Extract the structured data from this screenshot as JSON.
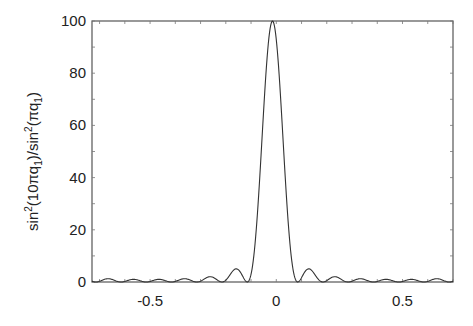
{
  "chart_data": {
    "type": "line",
    "title": "",
    "xlabel": "",
    "ylabel": "sin²(10πq₁)/sin²(πq₁)",
    "ylabel_parts": {
      "a": "sin",
      "sup1": "2",
      "b": "(10πq",
      "sub1": "1",
      "c": ")/sin",
      "sup2": "2",
      "d": "(πq",
      "sub2": "1",
      "e": ")"
    },
    "xlim": [
      -0.73,
      0.7
    ],
    "ylim": [
      0,
      100
    ],
    "x_ticks": [
      -0.5,
      0,
      0.5
    ],
    "x_tick_labels": [
      "-0.5",
      "0",
      "0.5"
    ],
    "x_minor_step": 0.1,
    "y_ticks": [
      0,
      20,
      40,
      60,
      80,
      100
    ],
    "y_tick_labels": [
      "0",
      "20",
      "40",
      "60",
      "80",
      "100"
    ],
    "y_minor_step": 10,
    "grid": false,
    "legend": null,
    "function": {
      "expression": "sin^2(N*pi*(q - shift)) / sin^2(pi*(q - shift))",
      "N": 10,
      "shift": -0.015,
      "samples": 600
    },
    "series": [
      {
        "name": "sin^2(10 pi q1)/sin^2(pi q1)",
        "color": "#333333",
        "key_points": {
          "x": [
            -0.73,
            -0.615,
            -0.515,
            -0.415,
            -0.315,
            -0.215,
            -0.165,
            -0.115,
            -0.065,
            -0.015,
            0.035,
            0.085,
            0.135,
            0.185,
            0.285,
            0.385,
            0.485,
            0.585,
            0.7
          ],
          "y": [
            2.0,
            0.0,
            0.0,
            0.0,
            0.0,
            0.0,
            5.3,
            0.0,
            0.0,
            100.0,
            0.0,
            0.0,
            5.3,
            0.0,
            0.0,
            0.0,
            0.0,
            0.0,
            2.0
          ]
        }
      }
    ]
  },
  "layout": {
    "plot_left": 92,
    "plot_right": 453,
    "plot_top": 21,
    "plot_bottom": 282
  }
}
